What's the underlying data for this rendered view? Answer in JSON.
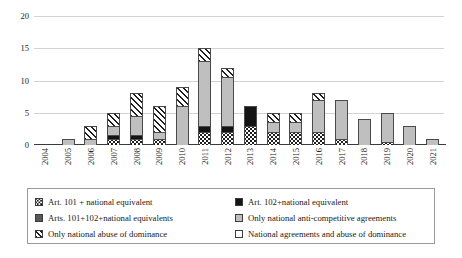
{
  "chart_data": {
    "type": "bar",
    "subtype": "stacked-bar",
    "title": "",
    "xlabel": "",
    "ylabel": "",
    "ylim": [
      0,
      20
    ],
    "yticks": [
      0,
      5,
      10,
      15,
      20
    ],
    "grid": "horizontal",
    "legend_position": "bottom",
    "categories": [
      "2004",
      "2005",
      "2006",
      "2007",
      "2008",
      "2009",
      "2010",
      "2011",
      "2012",
      "2013",
      "2014",
      "2015",
      "2016",
      "2017",
      "2018",
      "2019",
      "2020",
      "2021"
    ],
    "series": [
      {
        "name": "Art. 101 + national equivalent",
        "pattern": "dots",
        "values": [
          0,
          0,
          0,
          1,
          1,
          1,
          0,
          2,
          2,
          3,
          2,
          2,
          2,
          1,
          0,
          0.5,
          0,
          0
        ]
      },
      {
        "name": "Art. 102+national equivalent",
        "pattern": "black",
        "values": [
          0,
          0,
          0,
          0.5,
          0.5,
          0,
          0,
          1,
          1,
          3,
          0,
          0,
          0,
          0,
          0,
          0,
          0,
          0
        ]
      },
      {
        "name": "Arts. 101+102+national equivalents",
        "pattern": "darkgray",
        "values": [
          0,
          0,
          0,
          0,
          0,
          0,
          0,
          0,
          0,
          0,
          0,
          0,
          0,
          0,
          0,
          0,
          0,
          0
        ]
      },
      {
        "name": "Only national anti-competitive agreements",
        "pattern": "gray",
        "values": [
          0,
          1,
          1,
          1.5,
          3,
          1,
          6,
          10,
          7.5,
          0,
          1.5,
          1.5,
          5,
          6,
          4,
          4.5,
          3,
          1
        ]
      },
      {
        "name": "Only national abuse of dominance",
        "pattern": "hatch",
        "values": [
          0,
          0,
          2,
          2,
          3.5,
          4,
          3,
          2,
          1.5,
          0,
          1.5,
          1.5,
          1,
          0,
          0,
          0,
          0,
          0
        ]
      },
      {
        "name": "National agreements and abuse of dominance",
        "pattern": "white",
        "values": [
          0,
          0,
          0,
          0,
          0,
          0,
          0,
          0,
          0,
          0,
          0,
          0,
          0,
          0,
          0,
          0,
          0,
          0
        ]
      }
    ],
    "totals": [
      0,
      1,
      3,
      5,
      8,
      6,
      9,
      15,
      12,
      6,
      5,
      5,
      8,
      7,
      4,
      5,
      3,
      1
    ]
  },
  "legend": {
    "items": [
      {
        "label": "Art. 101 + national equivalent",
        "pattern": "dots"
      },
      {
        "label": "Art. 102+national equivalent",
        "pattern": "black"
      },
      {
        "label": "Arts. 101+102+national equivalents",
        "pattern": "darkgray"
      },
      {
        "label": "Only national anti-competitive agreements",
        "pattern": "gray"
      },
      {
        "label": "Only national abuse of dominance",
        "pattern": "hatch"
      },
      {
        "label": "National agreements and abuse of dominance",
        "pattern": "white"
      }
    ]
  },
  "colors": {
    "gridline": "#d3d3d3",
    "axis": "#3a3a3a",
    "gray_fill": "#bfbfbf",
    "dark_fill": "#595959",
    "black_fill": "#141414",
    "text": "#1a1a1a",
    "legend_border": "#9a9a9a"
  }
}
